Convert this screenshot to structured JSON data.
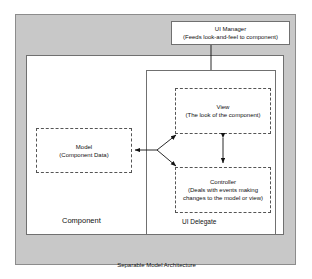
{
  "diagram": {
    "title": "Separable Model Architecture",
    "outer_frame": {
      "label": "Separable Model Architecture",
      "fill_color": "#c8c8c8",
      "border_color": "#8c8c8c"
    },
    "ui_manager": {
      "title": "UI Manager",
      "subtitle": "(Feeds look-and-feel to component)"
    },
    "component": {
      "label": "Component",
      "fill_color": "#ffffff",
      "border_color": "#707070"
    },
    "ui_delegate": {
      "label": "UI Delegate",
      "fill_color": "#ffffff",
      "border_color": "#707070"
    },
    "model": {
      "title": "Model",
      "subtitle": "(Component Data)",
      "border_style": "dashed"
    },
    "view": {
      "title": "View",
      "subtitle": "(The look of the component)",
      "border_style": "dashed"
    },
    "controller": {
      "title": "Controller",
      "subtitle_line1": "(Deals with events making",
      "subtitle_line2": "changes to the model or view)",
      "border_style": "dashed"
    },
    "connectors": [
      {
        "name": "ui-manager-to-ui-delegate",
        "from": "UI Manager",
        "to": "UI Delegate",
        "style": "solid",
        "arrowheads": "none"
      },
      {
        "name": "model-to-view-and-controller",
        "from": "Model",
        "to": "View and Controller",
        "style": "solid-fork",
        "arrowheads": "three"
      },
      {
        "name": "view-controller-bidirectional",
        "from": "View",
        "to": "Controller",
        "style": "solid",
        "arrowheads": "both"
      }
    ],
    "line_color": "#111111"
  }
}
